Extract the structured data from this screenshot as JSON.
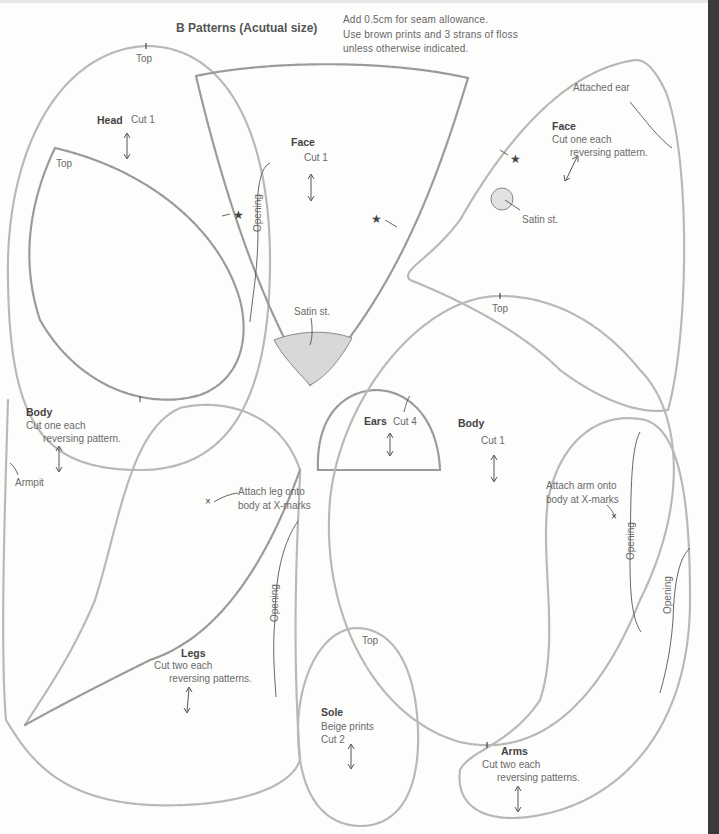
{
  "page": {
    "title": "B Patterns (Acutual size)",
    "notes": [
      "Add 0.5cm for seam allowance.",
      "Use brown prints and 3 strans of floss",
      "unless otherwise indicated."
    ],
    "colors": {
      "paper": "#fdfdfc",
      "outline": "#b8b8b6",
      "text": "#6a6a6a",
      "edge_strip": "#3a3a3a"
    }
  },
  "pieces": {
    "head": {
      "name": "Head",
      "cut": "Cut 1",
      "top": "Top"
    },
    "head_inner": {
      "top": "Top"
    },
    "face_center": {
      "name": "Face",
      "cut": "Cut 1",
      "opening": "Opening",
      "satin": "Satin st."
    },
    "face_side": {
      "name": "Face",
      "cut_line1": "Cut one each",
      "cut_line2": "reversing pattern.",
      "attached_ear": "Attached ear",
      "satin": "Satin st."
    },
    "ears": {
      "name": "Ears",
      "cut": "Cut 4"
    },
    "body_center": {
      "name": "Body",
      "cut": "Cut 1",
      "top": "Top"
    },
    "body_side": {
      "name": "Body",
      "cut_line1": "Cut one each",
      "cut_line2": "reversing pattern.",
      "armpit": "Armpit"
    },
    "legs": {
      "name": "Legs",
      "cut_line1": "Cut two each",
      "cut_line2": "reversing patterns.",
      "attach_line1": "Attach leg onto",
      "attach_line2": "body at X-marks",
      "opening": "Opening"
    },
    "sole": {
      "name": "Sole",
      "fabric": "Beige prints",
      "cut": "Cut 2",
      "top": "Top"
    },
    "arms": {
      "name": "Arms",
      "cut_line1": "Cut two each",
      "cut_line2": "reversing patterns.",
      "attach_line1": "Attach arm onto",
      "attach_line2": "body at X-marks",
      "opening_1": "Opening",
      "opening_2": "Opening"
    }
  },
  "symbols": {
    "star": "★",
    "x_mark": "×"
  }
}
